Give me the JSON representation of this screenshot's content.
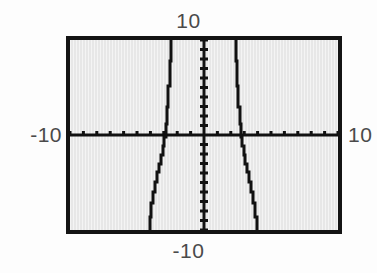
{
  "screen": {
    "device": "graphing-calculator",
    "background_color": "#e7e7e7",
    "frame_color": "#141414",
    "trace_color": "#111111"
  },
  "labels": {
    "y_max": "10",
    "y_min": "-10",
    "x_min": "-10",
    "x_max": "10"
  },
  "chart_data": {
    "type": "line",
    "title": "",
    "xlabel": "",
    "ylabel": "",
    "xlim": [
      -10,
      10
    ],
    "ylim": [
      -10,
      10
    ],
    "xtick_step": 1,
    "ytick_step": 1,
    "grid": false,
    "legend": null,
    "axes": {
      "x_axis_at_y": 0,
      "y_axis_at_x": 0,
      "tick_marks": true,
      "tick_count_x": 20,
      "tick_count_y": 20
    },
    "tick_labels": {
      "x": [
        "-10",
        "10"
      ],
      "y": [
        "-10",
        "10"
      ]
    },
    "series": [
      {
        "name": "left-branch",
        "x": [
          -4.05,
          -3.95,
          -3.8,
          -3.65,
          -3.5,
          -3.35,
          -3.2,
          -3.05,
          -2.95,
          -2.85,
          -2.75,
          -2.65,
          -2.55,
          -2.45,
          -2.4
        ],
        "y": [
          -10.0,
          -8.6,
          -7.2,
          -6.0,
          -4.9,
          -3.9,
          -3.0,
          -2.1,
          -1.2,
          -0.2,
          1.2,
          3.0,
          5.2,
          7.8,
          10.0
        ]
      },
      {
        "name": "right-branch",
        "x": [
          2.4,
          2.45,
          2.55,
          2.65,
          2.75,
          2.85,
          2.95,
          3.05,
          3.2,
          3.35,
          3.5,
          3.65,
          3.8,
          3.95,
          4.05
        ],
        "y": [
          10.0,
          7.8,
          5.2,
          3.0,
          1.2,
          -0.2,
          -1.2,
          -2.1,
          -3.0,
          -3.9,
          -4.9,
          -6.0,
          -7.2,
          -8.6,
          -10.0
        ]
      }
    ],
    "annotations": []
  }
}
